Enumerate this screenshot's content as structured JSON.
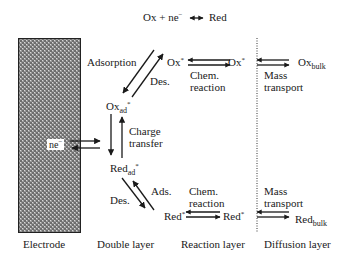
{
  "equation": {
    "left": "Ox + ne",
    "superscript": "−",
    "arrow": "⟷",
    "right": "Red"
  },
  "electrode": {
    "label": "Electrode",
    "electron_label": "ne",
    "electron_sup": "−",
    "fill_color": "#8a8a8a",
    "border_color": "#222222"
  },
  "species": {
    "ox_ad": {
      "base": "Ox",
      "sub": "ad",
      "sup": "*"
    },
    "red_ad": {
      "base": "Red",
      "sub": "ad",
      "sup": "*"
    },
    "ox_star_1": {
      "base": "Ox",
      "sup": "*"
    },
    "ox_star_2": {
      "base": "Ox",
      "sup": "*"
    },
    "red_star_1": {
      "base": "Red",
      "sup": "*"
    },
    "red_star_2": {
      "base": "Red",
      "sup": "*"
    },
    "ox_bulk": {
      "base": "Ox",
      "sub": "bulk"
    },
    "red_bulk": {
      "base": "Red",
      "sub": "bulk"
    }
  },
  "process_labels": {
    "adsorption": "Adsorption",
    "des_top": "Des.",
    "charge_transfer_1": "Charge",
    "charge_transfer_2": "transfer",
    "ads_bottom": "Ads.",
    "des_bottom": "Des.",
    "chem_reaction_top_1": "Chem.",
    "chem_reaction_top_2": "reaction",
    "chem_reaction_bottom_1": "Chem.",
    "chem_reaction_bottom_2": "reaction",
    "mass_transport_top_1": "Mass",
    "mass_transport_top_2": "transport",
    "mass_transport_bottom_1": "Mass",
    "mass_transport_bottom_2": "transport"
  },
  "layers": [
    "Electrode",
    "Double layer",
    "Reaction layer",
    "Diffusion layer"
  ],
  "colors": {
    "line": "#1a1a1a",
    "text": "#1a1a1a",
    "background": "#ffffff"
  }
}
